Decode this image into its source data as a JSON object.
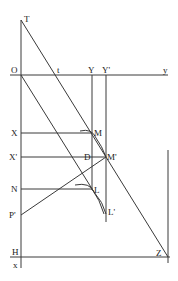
{
  "diagram": {
    "title": "",
    "labels": {
      "T": "T",
      "O": "O",
      "t": "t",
      "Y": "Y",
      "Yp": "Y'",
      "y": "y",
      "X": "X",
      "M": "M",
      "Xp": "X'",
      "D": "D",
      "Mp": "M'",
      "N": "N",
      "L": "L",
      "Pp": "P'",
      "Lp": "L'",
      "H": "H",
      "Z": "Z",
      "x": "x"
    },
    "points": {
      "T": [
        21,
        20
      ],
      "O": [
        21,
        75
      ],
      "t": [
        55,
        75
      ],
      "Y": [
        92,
        75
      ],
      "Yp": [
        106,
        75
      ],
      "X": [
        21,
        133
      ],
      "M": [
        92,
        133
      ],
      "Xp": [
        21,
        157
      ],
      "D": [
        92,
        157
      ],
      "Mp": [
        106,
        157
      ],
      "N": [
        21,
        189
      ],
      "L": [
        92,
        189
      ],
      "Pp": [
        21,
        215
      ],
      "Lp": [
        106,
        214
      ],
      "H": [
        21,
        257
      ],
      "Z": [
        168,
        257
      ]
    },
    "line_color": "#3a3a3a"
  }
}
